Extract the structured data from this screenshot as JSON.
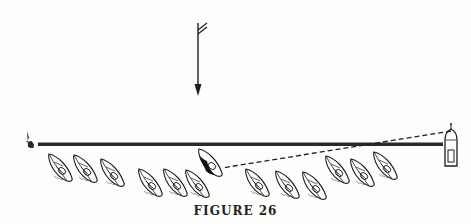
{
  "figure": {
    "caption": "FIGURE 26",
    "colors": {
      "ink": "#1e1e1e",
      "line": "#2a2a2a",
      "background": "#fdfdfb"
    },
    "wind_arrow": {
      "x": 198,
      "y_top": 23,
      "y_bottom": 95,
      "direction": "down"
    },
    "starting_line": {
      "x1": 38,
      "x2": 443,
      "y": 144
    },
    "pin_buoy": {
      "x": 30,
      "y": 144
    },
    "committee_boat": {
      "x": 451,
      "y": 146
    },
    "sight_line": {
      "x1": 451,
      "y1": 131,
      "x2": 222,
      "y2": 168,
      "style": "dashed"
    },
    "highlighted_boat": {
      "x": 210,
      "y": 163,
      "fill": "black"
    },
    "fleet_boats": [
      {
        "x": 60,
        "y": 168
      },
      {
        "x": 85,
        "y": 169
      },
      {
        "x": 112,
        "y": 173
      },
      {
        "x": 150,
        "y": 183
      },
      {
        "x": 175,
        "y": 183
      },
      {
        "x": 197,
        "y": 184
      },
      {
        "x": 257,
        "y": 183
      },
      {
        "x": 287,
        "y": 185
      },
      {
        "x": 314,
        "y": 186
      },
      {
        "x": 337,
        "y": 170
      },
      {
        "x": 362,
        "y": 173
      },
      {
        "x": 385,
        "y": 166
      }
    ]
  }
}
